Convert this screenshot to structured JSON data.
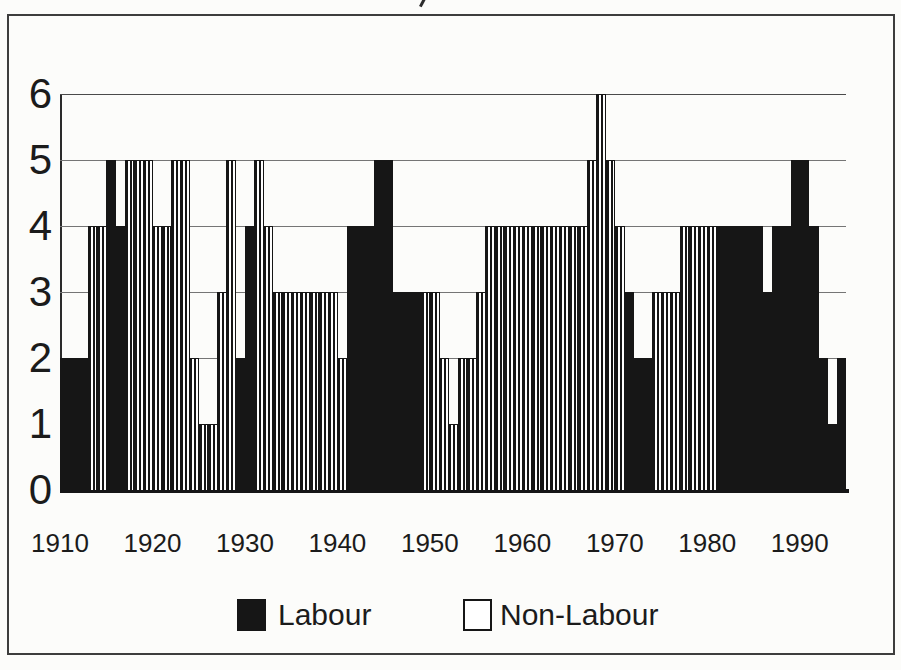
{
  "figure": {
    "colors": {
      "ink": "#161616",
      "paper": "#fcfcfa",
      "gridline": "#757575",
      "border": "#3d3d3d"
    }
  },
  "chart_data": {
    "type": "bar",
    "title": "",
    "xlabel": "",
    "ylabel": "",
    "start_year": 1910,
    "end_year": 1994,
    "ylim": [
      0,
      6
    ],
    "grid": "horizontal gridlines at 1,2,3,4,5,6",
    "y_ticks": [
      "0",
      "1",
      "2",
      "3",
      "4",
      "5",
      "6"
    ],
    "x_tick_labels": [
      "1910",
      "1920",
      "1930",
      "1940",
      "1950",
      "1960",
      "1970",
      "1980",
      "1990"
    ],
    "values": [
      2,
      2,
      2,
      4,
      4,
      5,
      4,
      5,
      5,
      5,
      4,
      4,
      5,
      5,
      2,
      1,
      1,
      3,
      5,
      2,
      4,
      5,
      4,
      3,
      3,
      3,
      3,
      3,
      3,
      3,
      2,
      4,
      4,
      4,
      5,
      5,
      3,
      3,
      3,
      3,
      3,
      2,
      1,
      2,
      2,
      3,
      4,
      4,
      4,
      4,
      4,
      4,
      4,
      4,
      4,
      4,
      4,
      5,
      6,
      5,
      4,
      3,
      2,
      2,
      3,
      3,
      3,
      4,
      4,
      4,
      4,
      4,
      4,
      4,
      4,
      4,
      3,
      4,
      4,
      5,
      5,
      4,
      2,
      1,
      2
    ],
    "party_by_year": "LLLNNLLNNNNNNNNNNNNLLNNNNNNNNNNLLLLLLLLNNNNNNNNNNNNNNNNNNNNNNLLLNNNNNNNLLLLLLLLLLLLLL",
    "party_codes": {
      "L": "Labour",
      "N": "Non-Labour"
    },
    "bar_style": {
      "Labour": "solid-black",
      "Non-Labour": "white-with-vertical-stripes"
    },
    "legend": [
      {
        "label": "Labour",
        "swatch": "solid-black"
      },
      {
        "label": "Non-Labour",
        "swatch": "white-outlined"
      }
    ],
    "legend_position": "bottom-center"
  }
}
